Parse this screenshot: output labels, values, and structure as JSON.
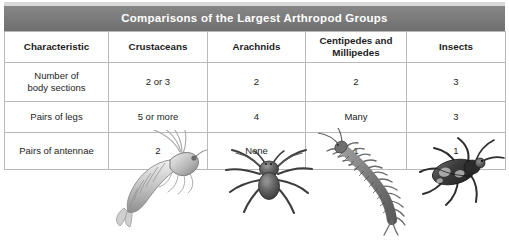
{
  "figure": {
    "title": "Comparisons of the Largest Arthropod Groups"
  },
  "table": {
    "columns": [
      {
        "key": "characteristic",
        "label": "Characteristic"
      },
      {
        "key": "crustaceans",
        "label": "Crustaceans"
      },
      {
        "key": "arachnids",
        "label": "Arachnids"
      },
      {
        "key": "centipedes_millipedes",
        "label": "Centipedes and Millipedes"
      },
      {
        "key": "insects",
        "label": "Insects"
      }
    ],
    "column_header_lines": {
      "centipedes_millipedes": [
        "Centipedes and",
        "Millipedes"
      ]
    },
    "rows": [
      {
        "characteristic": "Number of body sections",
        "characteristic_lines": [
          "Number of",
          "body sections"
        ],
        "crustaceans": "2 or 3",
        "arachnids": "2",
        "centipedes_millipedes": "2",
        "insects": "3"
      },
      {
        "characteristic": "Pairs of legs",
        "characteristic_lines": [
          "Pairs of legs"
        ],
        "crustaceans": "5 or more",
        "arachnids": "4",
        "centipedes_millipedes": "Many",
        "insects": "3"
      },
      {
        "characteristic": "Pairs of antennae",
        "characteristic_lines": [
          "Pairs of antennae"
        ],
        "crustaceans": "2",
        "arachnids": "None",
        "centipedes_millipedes": "1",
        "insects": "1"
      }
    ]
  },
  "illustrations": [
    {
      "name": "shrimp-illustration",
      "group": "Crustaceans",
      "alt": "Grayscale drawing of a shrimp with long antennae"
    },
    {
      "name": "spider-illustration",
      "group": "Arachnids",
      "alt": "Grayscale drawing of a spider with eight legs"
    },
    {
      "name": "centipede-illustration",
      "group": "Centipedes and Millipedes",
      "alt": "Grayscale drawing of a centipede with many legs"
    },
    {
      "name": "beetle-illustration",
      "group": "Insects",
      "alt": "Grayscale drawing of a beetle"
    }
  ],
  "colors": {
    "title_bar": "#7c7c7c",
    "title_text": "#ffffff",
    "grid_line": "#b9b9b9",
    "body_text": "#1d1d1d",
    "page_background": "#ffffff"
  }
}
